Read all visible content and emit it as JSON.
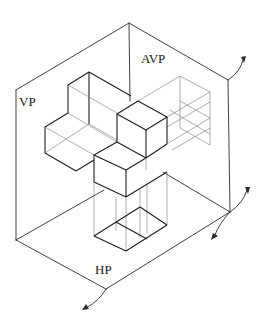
{
  "diagram": {
    "type": "orthographic projection planes with isometric solid",
    "labels": {
      "vp": "VP",
      "avp": "AVP",
      "hp": "HP"
    },
    "planes": [
      {
        "id": "vp",
        "name": "Vertical Plane"
      },
      {
        "id": "avp",
        "name": "Auxiliary Vertical Plane"
      },
      {
        "id": "hp",
        "name": "Horizontal Plane"
      }
    ],
    "rotation_arrows": [
      {
        "id": "avp-top-rotation",
        "location": "top-right corner"
      },
      {
        "id": "avp-bottom-rotation",
        "location": "right corner"
      },
      {
        "id": "hp-rotation",
        "location": "bottom corner"
      }
    ],
    "colors": {
      "line": "#2a2a2a",
      "background": "#ffffff"
    }
  }
}
